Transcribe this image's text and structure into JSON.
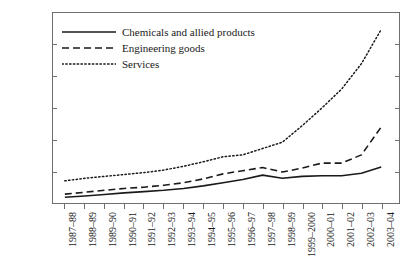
{
  "chart_data": {
    "type": "line",
    "title": "",
    "xlabel": "",
    "ylabel": "",
    "ylim": [
      0,
      30000
    ],
    "ytick_labels": [
      "0",
      "5000",
      "10000",
      "15000",
      "20000",
      "25000",
      "30000"
    ],
    "ytick_values": [
      0,
      5000,
      10000,
      15000,
      20000,
      25000,
      30000
    ],
    "grid": false,
    "legend_position": "top-left",
    "categories": [
      "1987–88",
      "1988–89",
      "1989–90",
      "1990–91",
      "1991–92",
      "1992–93",
      "1993–94",
      "1994–95",
      "1995–96",
      "1996–97",
      "1997–98",
      "1998–99",
      "1999–2000",
      "2000–01",
      "2001–02",
      "2002–03",
      "2003–04"
    ],
    "series": [
      {
        "name": "Chemicals and allied products",
        "style": "solid",
        "color": "#1a1a1a",
        "values": [
          900,
          1100,
          1350,
          1600,
          1800,
          2000,
          2300,
          2700,
          3200,
          3700,
          4400,
          3900,
          4200,
          4300,
          4300,
          4700,
          5700
        ]
      },
      {
        "name": "Engineering goods",
        "style": "dashed",
        "color": "#1a1a1a",
        "values": [
          1400,
          1700,
          2000,
          2300,
          2500,
          2800,
          3200,
          3800,
          4600,
          5100,
          5600,
          4900,
          5500,
          6300,
          6300,
          7600,
          12000
        ]
      },
      {
        "name": "Services",
        "style": "dotted",
        "color": "#1a1a1a",
        "values": [
          3500,
          3900,
          4200,
          4500,
          4800,
          5200,
          5800,
          6500,
          7300,
          7600,
          8600,
          9600,
          12200,
          15000,
          18000,
          22000,
          27400
        ]
      }
    ]
  },
  "axis": {
    "frame_color": "#6e6e6e"
  }
}
